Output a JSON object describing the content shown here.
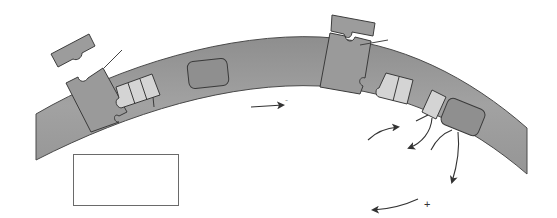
{
  "diagram": {
    "type": "membrane-signaling-schematic",
    "colors": {
      "membrane": "#9a9a9a",
      "membrane_stroke": "#4a4a4a",
      "protein": "#9e9e9e",
      "protein_dark": "#8c8c8c",
      "subunit_light": "#d6d6d6",
      "arrow": "#333333",
      "background": "#ffffff"
    },
    "signs": {
      "minus": "-",
      "plus": "+"
    },
    "label_box": {
      "text": ""
    },
    "elements": [
      {
        "id": "membrane",
        "shape": "curved-band"
      },
      {
        "id": "ligand-left",
        "shape": "notched-rectangle",
        "state": "detached"
      },
      {
        "id": "receptor-left",
        "shape": "notched-block"
      },
      {
        "id": "subunits-left",
        "shape": "three-segment-block",
        "count": 3
      },
      {
        "id": "effector-mid",
        "shape": "rounded-rectangle"
      },
      {
        "id": "ligand-right",
        "shape": "notched-rectangle",
        "state": "bound"
      },
      {
        "id": "receptor-right",
        "shape": "notched-block"
      },
      {
        "id": "subunits-right",
        "shape": "two-segment-block",
        "count": 2
      },
      {
        "id": "subunit-single",
        "shape": "single-segment-block",
        "count": 1
      },
      {
        "id": "effector-right",
        "shape": "rounded-rectangle"
      },
      {
        "id": "arrow-mid",
        "shape": "straight-arrow"
      },
      {
        "id": "arrows-right",
        "shape": "curved-arrows",
        "count": 4
      }
    ]
  }
}
